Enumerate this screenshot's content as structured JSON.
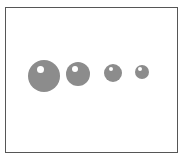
{
  "figure": {
    "title": "Sphere Size Series",
    "background_color": "#ffffff",
    "frame": {
      "border_color": "#565656",
      "border_width_px": 1,
      "fill_color": "#ffffff",
      "x_px": 5,
      "y_px": 7,
      "width_px": 173,
      "height_px": 146
    }
  },
  "chart_data": {
    "type": "scatter",
    "title": "",
    "subtitle": "",
    "xlabel": "",
    "ylabel": "",
    "grid": false,
    "legend": null,
    "axis_ticks_visible": false,
    "axis_labels_visible": false,
    "marker_style": "shaded-sphere",
    "marker_fill_color": "#8c8c8c",
    "marker_highlight_color": "#ffffff",
    "xlim": [
      0,
      173
    ],
    "ylim": [
      0,
      146
    ],
    "categories": [
      "1",
      "2",
      "3",
      "4"
    ],
    "values": [
      32,
      24,
      18,
      14
    ],
    "series": [
      {
        "name": "sphere-diameter-px",
        "values": [
          32,
          24,
          18,
          14
        ]
      }
    ],
    "points": [
      {
        "label": "sphere-1",
        "index": 1,
        "center_x_px": 44,
        "center_y_px": 76,
        "diameter_px": 32,
        "radius_px": 16,
        "highlight_center_x_px": 40,
        "highlight_center_y_px": 69,
        "highlight_diameter_px": 7
      },
      {
        "label": "sphere-2",
        "index": 2,
        "center_x_px": 78,
        "center_y_px": 74,
        "diameter_px": 24,
        "radius_px": 12,
        "highlight_center_x_px": 75,
        "highlight_center_y_px": 69,
        "highlight_diameter_px": 6
      },
      {
        "label": "sphere-3",
        "index": 3,
        "center_x_px": 113,
        "center_y_px": 73,
        "diameter_px": 18,
        "radius_px": 9,
        "highlight_center_x_px": 111,
        "highlight_center_y_px": 69,
        "highlight_diameter_px": 4
      },
      {
        "label": "sphere-4",
        "index": 4,
        "center_x_px": 142,
        "center_y_px": 72,
        "diameter_px": 14,
        "radius_px": 7,
        "highlight_center_x_px": 140,
        "highlight_center_y_px": 69,
        "highlight_diameter_px": 4
      }
    ],
    "annotations": []
  }
}
